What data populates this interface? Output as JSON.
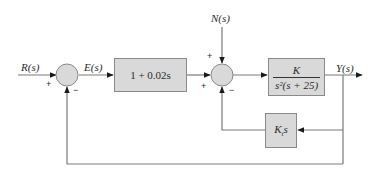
{
  "diagram": {
    "type": "feedback-control-block-diagram",
    "signals": {
      "input": "R(s)",
      "error": "E(s)",
      "disturbance": "N(s)",
      "output": "Y(s)"
    },
    "blocks": {
      "controller": {
        "label": "1 + 0.02s"
      },
      "plant": {
        "numerator": "K",
        "denominator": "s²(s + 25)"
      },
      "tach_feedback": {
        "label": "Kₜs",
        "main": "K",
        "sub": "t",
        "suffix": "s"
      }
    },
    "summing_junctions": {
      "sum1": {
        "signs": {
          "input_left": "+",
          "input_bottom": "−"
        }
      },
      "sum2": {
        "signs": {
          "input_top": "+",
          "input_left": "+",
          "input_bottom": "−"
        }
      }
    },
    "colors": {
      "block_fill": "#d9d9d9",
      "block_border": "#8a8a8a",
      "line": "#7a7a7a",
      "arrow": "#1a1a1a",
      "text": "#2b2b2b"
    }
  }
}
